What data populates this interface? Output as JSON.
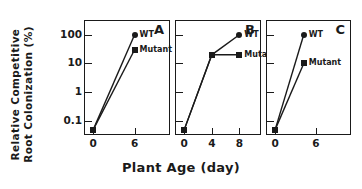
{
  "chart_data": {
    "type": "line",
    "title": "",
    "xlabel": "Plant Age (day)",
    "ylabel": "Relative Competitive Root Colonization (%)",
    "ylabel_line1": "Relative Competitive",
    "ylabel_line2": "Root Colonization (%)",
    "yscale": "log",
    "ylim": [
      0.03,
      300
    ],
    "yticks": [
      100,
      10,
      1,
      0.1
    ],
    "yticklabels": [
      "100",
      "10",
      "1",
      "0.1"
    ],
    "grid": false,
    "legend_position": "inside-panel",
    "marker_wt": "circle",
    "marker_mutant": "square",
    "color_line": "#1a1a1a",
    "panels": [
      {
        "letter": "A",
        "xlim": [
          -1.2,
          11
        ],
        "xticks": [
          0,
          6
        ],
        "xticklabels": [
          "0",
          "6"
        ],
        "series": [
          {
            "name": "WT",
            "label": "WT",
            "marker": "circle",
            "x": [
              0,
              6
            ],
            "y": [
              0.05,
              100
            ]
          },
          {
            "name": "Mutant",
            "label": "Mutant",
            "marker": "square",
            "x": [
              0,
              6
            ],
            "y": [
              0.05,
              30
            ]
          }
        ]
      },
      {
        "letter": "B",
        "xlim": [
          -1.2,
          11
        ],
        "xticks": [
          0,
          4,
          8
        ],
        "xticklabels": [
          "0",
          "4",
          "8"
        ],
        "series": [
          {
            "name": "WT",
            "label": "WT",
            "marker": "circle",
            "x": [
              0,
              4,
              8
            ],
            "y": [
              0.05,
              20,
              100
            ]
          },
          {
            "name": "Mutant",
            "label": "Mutant",
            "marker": "square",
            "x": [
              0,
              4,
              8
            ],
            "y": [
              0.05,
              20,
              20
            ]
          }
        ]
      },
      {
        "letter": "C",
        "xlim": [
          -1.2,
          11
        ],
        "xticks": [
          0,
          6
        ],
        "xticklabels": [
          "0",
          "6"
        ],
        "series": [
          {
            "name": "WT",
            "label": "WT",
            "marker": "circle",
            "x": [
              0,
              4.2
            ],
            "y": [
              0.05,
              100
            ]
          },
          {
            "name": "Mutant",
            "label": "Mutant",
            "marker": "square",
            "x": [
              0,
              4.2
            ],
            "y": [
              0.05,
              10
            ]
          }
        ]
      }
    ]
  }
}
